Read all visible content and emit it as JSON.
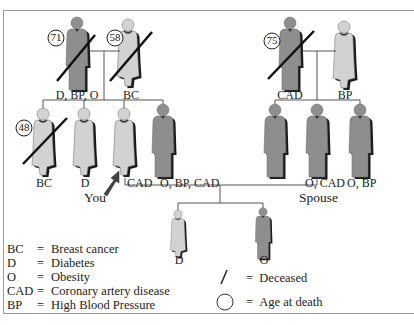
{
  "diagram": {
    "type": "family-pedigree",
    "colors": {
      "male": "#8e8e8e",
      "female": "#d2d2d2",
      "shadow": "#1a1a1a",
      "line": "#555555",
      "frame": "#9a9a9a"
    },
    "generation1": {
      "left_couple": {
        "father": {
          "sex": "male",
          "deceased": true,
          "age_at_death": "71",
          "conditions": "D, BP, O"
        },
        "mother": {
          "sex": "female",
          "deceased": true,
          "age_at_death": "58",
          "conditions": "BC"
        }
      },
      "right_couple": {
        "father": {
          "sex": "male",
          "deceased": true,
          "age_at_death": "75",
          "conditions": "CAD"
        },
        "mother": {
          "sex": "female",
          "deceased": false,
          "conditions": "BP"
        }
      }
    },
    "generation2": {
      "left_siblings": [
        {
          "sex": "female",
          "deceased": true,
          "age_at_death": "48",
          "conditions": "BC"
        },
        {
          "sex": "female",
          "deceased": false,
          "conditions": "D"
        },
        {
          "sex": "female",
          "deceased": false,
          "conditions": "CAD",
          "pointer_label": "You"
        },
        {
          "sex": "male",
          "deceased": false,
          "conditions": "O, BP, CAD"
        }
      ],
      "right_siblings": [
        {
          "sex": "male",
          "deceased": false,
          "conditions": ""
        },
        {
          "sex": "male",
          "deceased": false,
          "conditions": "O, CAD",
          "role_label": "Spouse"
        },
        {
          "sex": "male",
          "deceased": false,
          "conditions": "O, BP"
        }
      ]
    },
    "generation3": [
      {
        "sex": "female",
        "conditions": "D"
      },
      {
        "sex": "male",
        "conditions": "O"
      }
    ],
    "legend": {
      "abbreviations": [
        {
          "key": "BC",
          "eq": "=",
          "text": "Breast cancer"
        },
        {
          "key": "D",
          "eq": "=",
          "text": "Diabetes"
        },
        {
          "key": "O",
          "eq": "=",
          "text": "Obesity"
        },
        {
          "key": "CAD",
          "eq": "=",
          "text": "Coronary artery disease"
        },
        {
          "key": "BP",
          "eq": "=",
          "text": "High Blood Pressure"
        }
      ],
      "symbols": [
        {
          "symbol": "slash",
          "eq": "=",
          "text": "Deceased"
        },
        {
          "symbol": "circle",
          "eq": "=",
          "text": "Age at death"
        }
      ]
    }
  }
}
